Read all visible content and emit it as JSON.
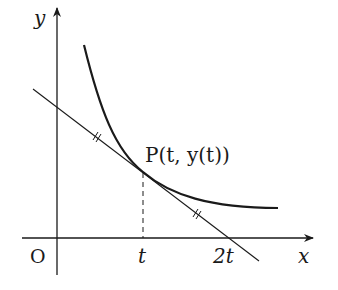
{
  "diagram": {
    "axes": {
      "x_label": "x",
      "y_label": "y",
      "origin_label": "O"
    },
    "x_ticks": [
      {
        "label": "t"
      },
      {
        "label": "2t"
      }
    ],
    "point": {
      "label": "P(t, y(t))"
    },
    "elements": {
      "curve": "decreasing convex curve y(t)",
      "tangent_line": "tangent line at P crossing x-axis at 2t",
      "dashed_line": "vertical dashed line from P to x-axis at t",
      "equal_marks": "double tick marks indicating equal segments"
    },
    "colors": {
      "stroke": "#1a1a1a",
      "background": "#ffffff"
    }
  }
}
